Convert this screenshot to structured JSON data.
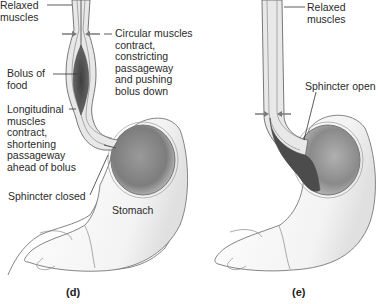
{
  "panels": [
    {
      "id": "d",
      "caption": "(d)",
      "labels": {
        "relaxed_muscles": "Relaxed\nmuscles",
        "circular_muscles": "Circular muscles\ncontract,\nconstricting\npassageway\nand pushing\nbolus down",
        "bolus": "Bolus of\nfood",
        "longitudinal": "Longitudinal\nmuscles\ncontract,\nshortening\npassageway\nahead of bolus",
        "sphincter": "Sphincter closed",
        "stomach": "Stomach"
      }
    },
    {
      "id": "e",
      "caption": "(e)",
      "labels": {
        "relaxed_muscles": "Relaxed\nmuscles",
        "sphincter": "Sphincter open"
      }
    }
  ],
  "colors": {
    "outline": "#6a6a6a",
    "wall": "#e4e4e4",
    "bolus": "#4a4a4a",
    "stomach_lining": "#8c8c8c",
    "arrow": "#7a7a7a"
  }
}
